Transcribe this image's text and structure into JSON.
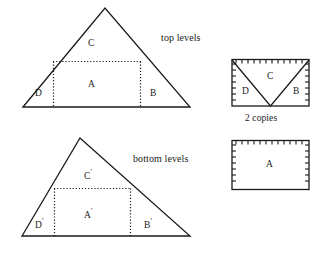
{
  "diagram": {
    "title_labels": {
      "top_levels": "top levels",
      "bottom_levels": "bottom levels",
      "two_copies": "2 copies"
    },
    "top_triangle": {
      "name": "top-levels-triangle",
      "regions": [
        {
          "id": "C",
          "label": "C"
        },
        {
          "id": "A",
          "label": "A"
        },
        {
          "id": "D",
          "label": "D"
        },
        {
          "id": "B",
          "label": "B"
        }
      ]
    },
    "bottom_triangle": {
      "name": "bottom-levels-triangle",
      "regions": [
        {
          "id": "Cp",
          "label": "C",
          "prime": "′"
        },
        {
          "id": "Ap",
          "label": "A",
          "prime": "′"
        },
        {
          "id": "Dp",
          "label": "D",
          "prime": "′"
        },
        {
          "id": "Bp",
          "label": "B",
          "prime": "′"
        }
      ]
    },
    "rect_dbc": {
      "name": "two-copies-rectangle",
      "regions": [
        {
          "id": "C",
          "label": "C"
        },
        {
          "id": "D",
          "label": "D"
        },
        {
          "id": "B",
          "label": "B"
        }
      ]
    },
    "rect_a": {
      "name": "rectangle-a",
      "regions": [
        {
          "id": "A",
          "label": "A"
        }
      ]
    },
    "colors": {
      "stroke": "#1a1a1a",
      "background": "#ffffff"
    }
  }
}
